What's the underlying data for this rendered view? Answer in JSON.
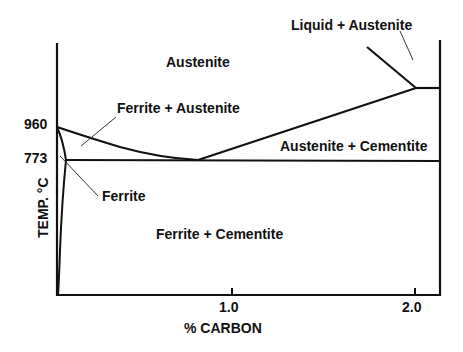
{
  "diagram": {
    "x_axis": {
      "label": "% CARBON",
      "ticks": [
        "1.0",
        "2.0"
      ]
    },
    "y_axis": {
      "label": "TEMP. °C",
      "ticks": [
        "960",
        "773"
      ]
    },
    "regions": {
      "austenite": "Austenite",
      "ferrite_austenite": "Ferrite + Austenite",
      "liquid_austenite": "Liquid + Austenite",
      "austenite_cementite": "Austenite + Cementite",
      "ferrite": "Ferrite",
      "ferrite_cementite": "Ferrite + Cementite"
    },
    "line_color": "#111111",
    "background": "#ffffff"
  }
}
